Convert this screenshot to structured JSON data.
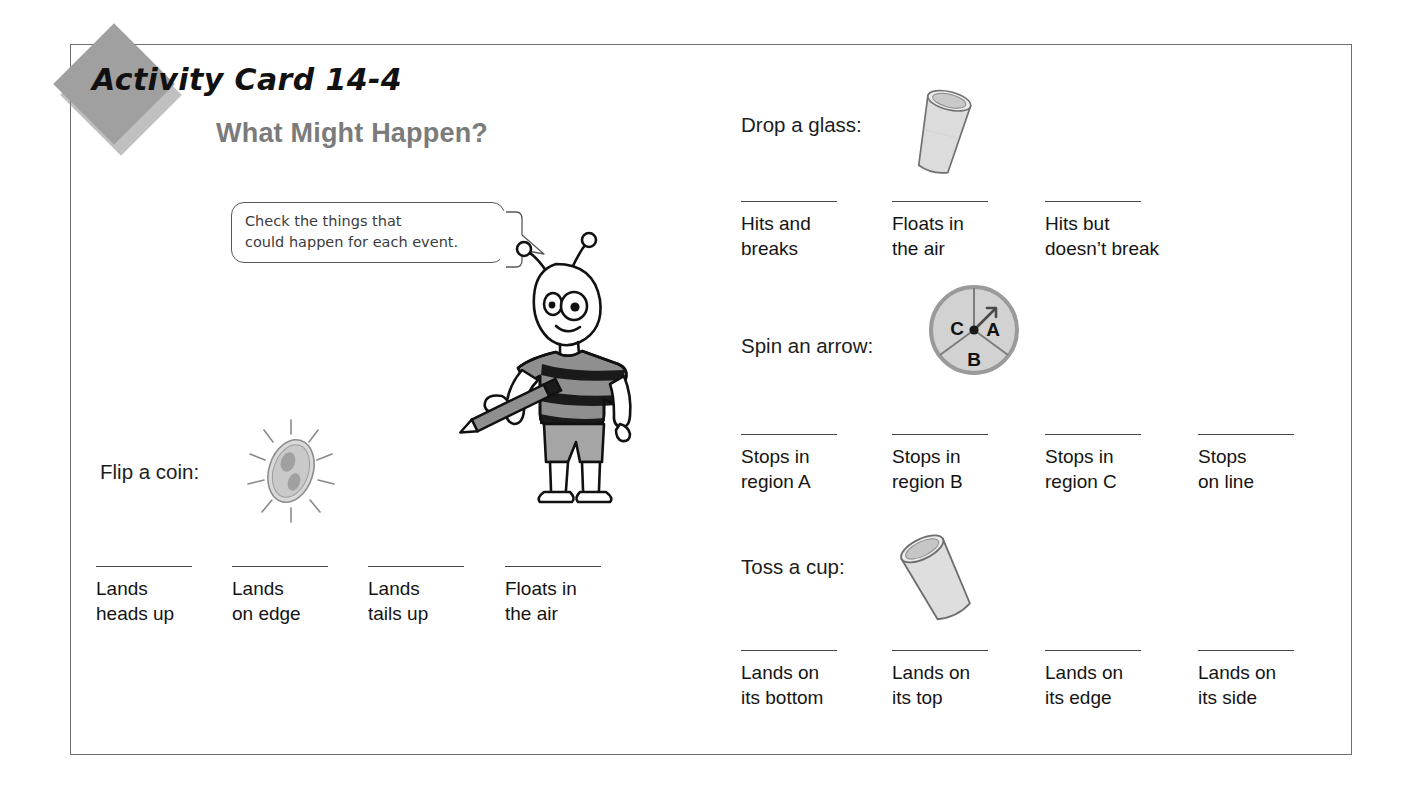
{
  "card": {
    "title": "Activity Card 14-4",
    "heading": "What Might Happen?",
    "instruction_line_1": "Check the things that",
    "instruction_line_2": "could happen for each event."
  },
  "spinner": {
    "region_a": "A",
    "region_b": "B",
    "region_c": "C"
  },
  "events": {
    "coin": {
      "prompt": "Flip a coin:",
      "options": [
        {
          "line1": "Lands",
          "line2": "heads up"
        },
        {
          "line1": "Lands",
          "line2": "on edge"
        },
        {
          "line1": "Lands",
          "line2": "tails up"
        },
        {
          "line1": "Floats in",
          "line2": "the air"
        }
      ]
    },
    "glass": {
      "prompt": "Drop a glass:",
      "options": [
        {
          "line1": "Hits and",
          "line2": "breaks"
        },
        {
          "line1": "Floats in",
          "line2": "the air"
        },
        {
          "line1": "Hits but",
          "line2": "doesn’t break"
        }
      ]
    },
    "arrow": {
      "prompt": "Spin an arrow:",
      "options": [
        {
          "line1": "Stops in",
          "line2": "region A"
        },
        {
          "line1": "Stops in",
          "line2": "region B"
        },
        {
          "line1": "Stops in",
          "line2": "region C"
        },
        {
          "line1": "Stops",
          "line2": "on line"
        }
      ]
    },
    "cup": {
      "prompt": "Toss a cup:",
      "options": [
        {
          "line1": "Lands on",
          "line2": "its bottom"
        },
        {
          "line1": "Lands on",
          "line2": "its top"
        },
        {
          "line1": "Lands on",
          "line2": "its edge"
        },
        {
          "line1": "Lands on",
          "line2": "its side"
        }
      ]
    }
  },
  "colors": {
    "diamond": "#a0a0a0",
    "heading": "#7b7b7b",
    "border": "#6e6e6e",
    "blank_line": "#464646",
    "illustration_fill": "#d8d8d8",
    "illustration_stroke": "#6a6a6a"
  }
}
